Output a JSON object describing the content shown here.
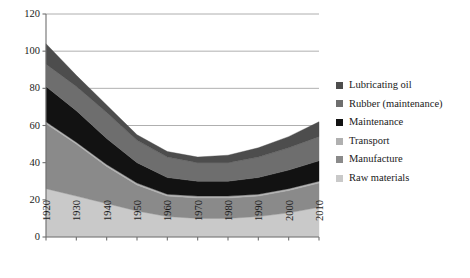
{
  "chart_data": {
    "type": "area",
    "stacked": true,
    "title": "",
    "xlabel": "",
    "ylabel": "",
    "x": [
      1920,
      1930,
      1940,
      1950,
      1960,
      1970,
      1980,
      1990,
      2000,
      2010
    ],
    "categories": [
      "1920",
      "1930",
      "1940",
      "1950",
      "1960",
      "1970",
      "1980",
      "1990",
      "2000",
      "2010"
    ],
    "xlim": [
      1920,
      2010
    ],
    "ylim": [
      0,
      120
    ],
    "yticks": [
      0,
      20,
      40,
      60,
      80,
      100,
      120
    ],
    "ytick_labels": [
      "0",
      "20",
      "40",
      "60",
      "80",
      "100",
      "120"
    ],
    "grid": "horizontal",
    "legend_position": "right",
    "series": [
      {
        "name": "Raw materials",
        "color": "#c9c9c9",
        "values": [
          26,
          22,
          18,
          14,
          11,
          10,
          10,
          11,
          13,
          16
        ]
      },
      {
        "name": "Manufacture",
        "color": "#8a8a8a",
        "values": [
          35,
          28,
          20,
          14,
          11,
          11,
          11,
          11,
          12,
          13
        ]
      },
      {
        "name": "Transport",
        "color": "#b0b0b0",
        "values": [
          1,
          1,
          1,
          1,
          1,
          1,
          1,
          1,
          1,
          1
        ]
      },
      {
        "name": "Maintenance",
        "color": "#121212",
        "values": [
          19,
          17,
          14,
          11,
          9,
          8,
          8,
          9,
          10,
          11
        ]
      },
      {
        "name": "Rubber (maintenance)",
        "color": "#6e6e6e",
        "values": [
          12,
          13,
          14,
          12,
          11,
          10,
          10,
          11,
          12,
          13
        ]
      },
      {
        "name": "Lubricating oil",
        "color": "#4d4d4d",
        "values": [
          11,
          6,
          4,
          3,
          3,
          3,
          4,
          5,
          6,
          8
        ]
      }
    ],
    "stack_totals": [
      104,
      87,
      71,
      55,
      46,
      43,
      44,
      48,
      54,
      62
    ],
    "legend_entries": [
      {
        "label": "Lubricating oil",
        "color": "#4d4d4d"
      },
      {
        "label": "Rubber (maintenance)",
        "color": "#6e6e6e"
      },
      {
        "label": "Maintenance",
        "color": "#121212"
      },
      {
        "label": "Transport",
        "color": "#b0b0b0"
      },
      {
        "label": "Manufacture",
        "color": "#8a8a8a"
      },
      {
        "label": "Raw materials",
        "color": "#c9c9c9"
      }
    ],
    "axis_color": "#6f6f6f",
    "grid_color": "#9a9a9a",
    "background": "#ffffff"
  }
}
